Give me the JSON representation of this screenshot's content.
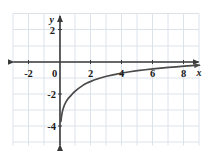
{
  "chart_data": {
    "type": "line",
    "title": "",
    "xlabel": "x",
    "ylabel": "y",
    "xlim": [
      -3,
      9.2
    ],
    "ylim": [
      -4.6,
      2.6
    ],
    "grid": true,
    "grid_spacing": 1,
    "legend": "none",
    "x_ticks": [
      -2,
      0,
      2,
      4,
      6,
      8
    ],
    "x_tick_labels": [
      "-2",
      "0",
      "2",
      "4",
      "6",
      "8"
    ],
    "y_ticks": [
      2,
      -2,
      -4
    ],
    "y_tick_labels": [
      "2",
      "-2",
      "-4"
    ],
    "series": [
      {
        "name": "logarithmic-curve",
        "description": "increasing logarithmic curve, vertical asymptote at x=0, x-intercept at x=1",
        "x": [
          0.06,
          0.08,
          0.1,
          0.13,
          0.17,
          0.22,
          0.28,
          0.36,
          0.45,
          0.55,
          0.7,
          0.85,
          1.0,
          1.2,
          1.5,
          1.8,
          2.2,
          2.6,
          3.0,
          3.5,
          4.0,
          4.5,
          5.0,
          5.5,
          6.0,
          6.5,
          7.0,
          7.5,
          8.0,
          8.5,
          9.0
        ],
        "y": [
          -3.84,
          -3.64,
          -3.49,
          -3.31,
          -3.13,
          -2.96,
          -2.79,
          -2.62,
          -2.47,
          -2.33,
          -2.17,
          -2.0,
          -1.87,
          -1.7,
          -1.49,
          -1.33,
          -1.16,
          -1.03,
          -0.92,
          -0.81,
          -0.71,
          -0.63,
          -0.56,
          -0.5,
          -0.45,
          -0.4,
          -0.35,
          -0.31,
          -0.27,
          -0.24,
          -0.21
        ]
      }
    ]
  },
  "axes": {
    "x_axis_name": "x-axis",
    "y_axis_name": "y-axis",
    "x_axis_label": "x",
    "y_axis_label": "y"
  },
  "colors": {
    "grid": "#d8dfe8",
    "axis": "#3a3a3a",
    "curve": "#4a4a4a",
    "text": "#1a1a1a",
    "background": "#ffffff"
  }
}
